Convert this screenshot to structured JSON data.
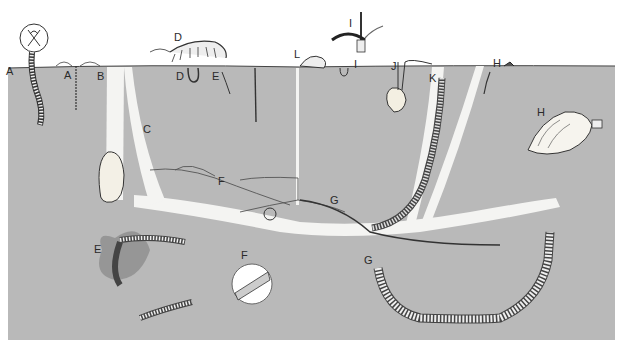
{
  "figure": {
    "colors": {
      "soil": "#b9b9b9",
      "burrow": "#f4f4f2",
      "ink": "#2a2a2a",
      "background": "#ffffff"
    },
    "labels": [
      {
        "id": "A1",
        "text": "A",
        "x": 6,
        "y": 66
      },
      {
        "id": "A2",
        "text": "A",
        "x": 64,
        "y": 70
      },
      {
        "id": "B",
        "text": "B",
        "x": 97,
        "y": 71
      },
      {
        "id": "C",
        "text": "C",
        "x": 145,
        "y": 125
      },
      {
        "id": "D1",
        "text": "D",
        "x": 175,
        "y": 33
      },
      {
        "id": "D2",
        "text": "D",
        "x": 176,
        "y": 71
      },
      {
        "id": "E1",
        "text": "E",
        "x": 213,
        "y": 71
      },
      {
        "id": "E2",
        "text": "E",
        "x": 94,
        "y": 245
      },
      {
        "id": "F1",
        "text": "F",
        "x": 218,
        "y": 177
      },
      {
        "id": "F2",
        "text": "F",
        "x": 241,
        "y": 251
      },
      {
        "id": "G1",
        "text": "G",
        "x": 330,
        "y": 196
      },
      {
        "id": "G2",
        "text": "G",
        "x": 364,
        "y": 256
      },
      {
        "id": "H1",
        "text": "H",
        "x": 493,
        "y": 59
      },
      {
        "id": "H2",
        "text": "H",
        "x": 537,
        "y": 108
      },
      {
        "id": "I1",
        "text": "I",
        "x": 349,
        "y": 19
      },
      {
        "id": "I2",
        "text": "I",
        "x": 354,
        "y": 60
      },
      {
        "id": "J",
        "text": "J",
        "x": 391,
        "y": 62
      },
      {
        "id": "K",
        "text": "K",
        "x": 429,
        "y": 74
      },
      {
        "id": "L",
        "text": "L",
        "x": 294,
        "y": 50
      }
    ]
  }
}
